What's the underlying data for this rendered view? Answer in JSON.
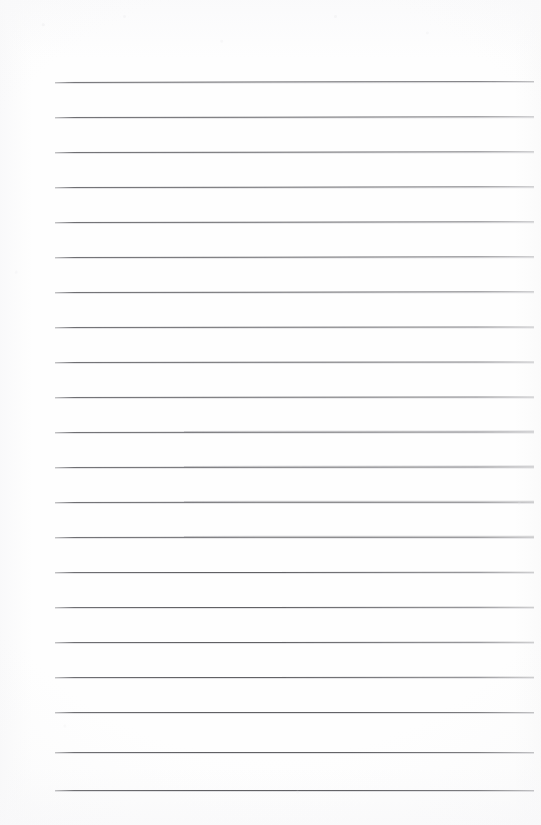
{
  "document": {
    "kind": "scanned-blank-lined-paper",
    "page_width": 541,
    "page_height": 825,
    "background_color": "#fefefe",
    "has_visible_text": false,
    "text_content": "",
    "notes_written": ""
  },
  "ruling": {
    "line_color": "#646468",
    "line_count": 21,
    "line_spacing_px": 35,
    "first_line_y": 82,
    "last_line_y": 792,
    "line_left_x": 55,
    "line_right_x": 534,
    "line_thickness_px": 1,
    "margin_rule_present": false,
    "holes_present": false,
    "lines": [
      {
        "index": 1,
        "y": 82,
        "left": 55,
        "right": 534,
        "tilt_deg": -0.12,
        "step": false
      },
      {
        "index": 2,
        "y": 117,
        "left": 55,
        "right": 534,
        "tilt_deg": -0.1,
        "step": false
      },
      {
        "index": 3,
        "y": 152,
        "left": 55,
        "right": 534,
        "tilt_deg": -0.1,
        "step": false
      },
      {
        "index": 4,
        "y": 187,
        "left": 55,
        "right": 534,
        "tilt_deg": -0.09,
        "step": false
      },
      {
        "index": 5,
        "y": 222,
        "left": 55,
        "right": 534,
        "tilt_deg": -0.09,
        "step": false
      },
      {
        "index": 6,
        "y": 257,
        "left": 55,
        "right": 534,
        "tilt_deg": -0.08,
        "step": false
      },
      {
        "index": 7,
        "y": 292,
        "left": 55,
        "right": 534,
        "tilt_deg": -0.08,
        "step": false
      },
      {
        "index": 8,
        "y": 327,
        "left": 55,
        "right": 534,
        "tilt_deg": -0.07,
        "step": false
      },
      {
        "index": 9,
        "y": 362,
        "left": 55,
        "right": 534,
        "tilt_deg": -0.07,
        "step": false
      },
      {
        "index": 10,
        "y": 397,
        "left": 55,
        "right": 534,
        "tilt_deg": -0.06,
        "step": false
      },
      {
        "index": 11,
        "y": 432,
        "left": 55,
        "right": 534,
        "tilt_deg": -0.05,
        "step": true
      },
      {
        "index": 12,
        "y": 467,
        "left": 55,
        "right": 534,
        "tilt_deg": -0.05,
        "step": true
      },
      {
        "index": 13,
        "y": 502,
        "left": 55,
        "right": 534,
        "tilt_deg": -0.04,
        "step": true
      },
      {
        "index": 14,
        "y": 537,
        "left": 55,
        "right": 534,
        "tilt_deg": -0.04,
        "step": true
      },
      {
        "index": 15,
        "y": 572,
        "left": 55,
        "right": 534,
        "tilt_deg": -0.03,
        "step": false
      },
      {
        "index": 16,
        "y": 607,
        "left": 55,
        "right": 534,
        "tilt_deg": -0.03,
        "step": false
      },
      {
        "index": 17,
        "y": 642,
        "left": 55,
        "right": 534,
        "tilt_deg": -0.02,
        "step": false
      },
      {
        "index": 18,
        "y": 677,
        "left": 55,
        "right": 534,
        "tilt_deg": -0.02,
        "step": false
      },
      {
        "index": 19,
        "y": 712,
        "left": 55,
        "right": 534,
        "tilt_deg": -0.01,
        "step": false
      },
      {
        "index": 20,
        "y": 752,
        "left": 55,
        "right": 534,
        "tilt_deg": -0.01,
        "step": false
      },
      {
        "index": 21,
        "y": 790,
        "left": 55,
        "right": 534,
        "tilt_deg": 0.0,
        "step": false
      }
    ]
  }
}
